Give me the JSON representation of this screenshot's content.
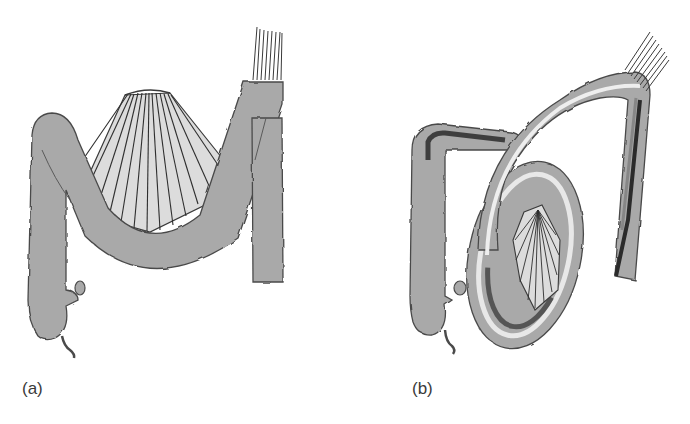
{
  "figure": {
    "panels": [
      {
        "id": "a",
        "label": "(a)"
      },
      {
        "id": "b",
        "label": "(b)"
      }
    ],
    "colors": {
      "bowel_fill": "#a9a9a9",
      "bowel_outline": "#4a4a4a",
      "mesentery_fill": "#dcdcdc",
      "mesentery_line": "#2e2e2e",
      "twist_dark": "#2b2b2b",
      "twist_light": "#e8e8e8",
      "background": "#ffffff"
    }
  }
}
